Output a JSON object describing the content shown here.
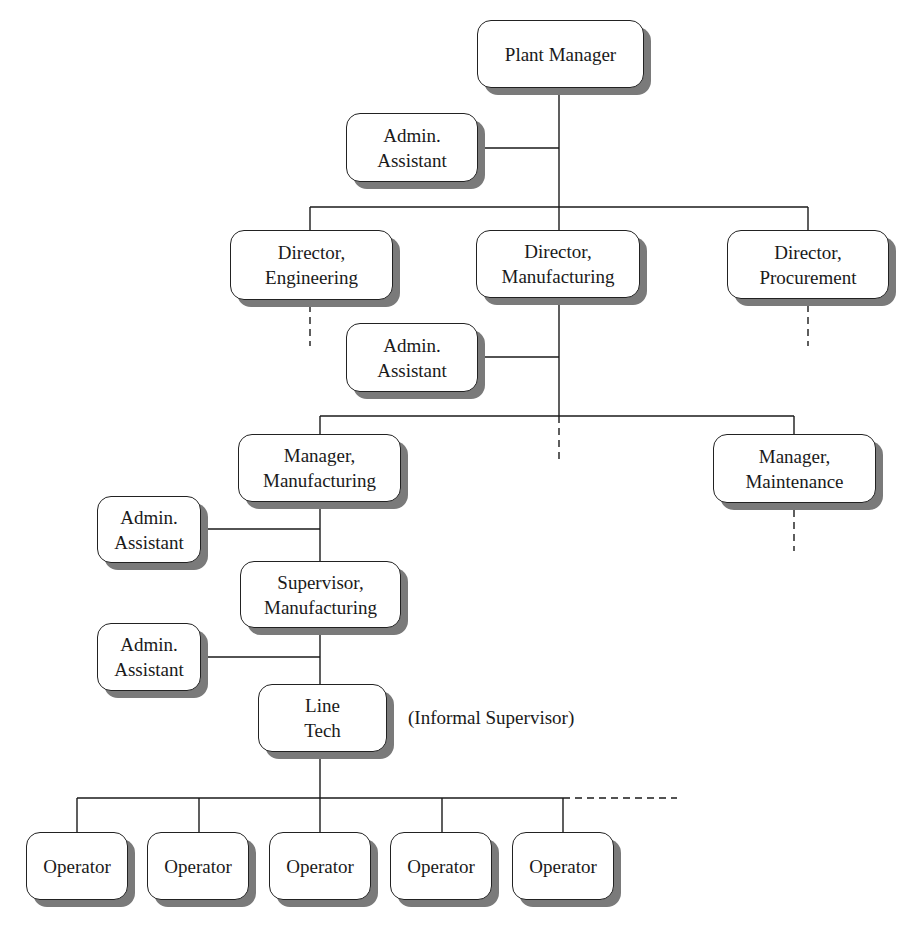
{
  "diagram": {
    "type": "organization-chart",
    "nodes": {
      "plant_manager": {
        "line1": "Plant Manager",
        "line2": ""
      },
      "admin_assistant_plant": {
        "line1": "Admin.",
        "line2": "Assistant"
      },
      "director_engineering": {
        "line1": "Director,",
        "line2": "Engineering"
      },
      "director_manufacturing": {
        "line1": "Director,",
        "line2": "Manufacturing"
      },
      "director_procurement": {
        "line1": "Director,",
        "line2": "Procurement"
      },
      "admin_assistant_director": {
        "line1": "Admin.",
        "line2": "Assistant"
      },
      "manager_manufacturing": {
        "line1": "Manager,",
        "line2": "Manufacturing"
      },
      "manager_maintenance": {
        "line1": "Manager,",
        "line2": "Maintenance"
      },
      "admin_assistant_manager": {
        "line1": "Admin.",
        "line2": "Assistant"
      },
      "supervisor_manufacturing": {
        "line1": "Supervisor,",
        "line2": "Manufacturing"
      },
      "admin_assistant_supervisor": {
        "line1": "Admin.",
        "line2": "Assistant"
      },
      "line_tech": {
        "line1": "Line",
        "line2": "Tech"
      },
      "operators": [
        {
          "label": "Operator"
        },
        {
          "label": "Operator"
        },
        {
          "label": "Operator"
        },
        {
          "label": "Operator"
        },
        {
          "label": "Operator"
        }
      ]
    },
    "annotations": {
      "line_tech_note": "(Informal Supervisor)"
    },
    "colors": {
      "line": "#1a1a1a",
      "shadow": "#7a7a7a",
      "box_fill": "#ffffff"
    }
  }
}
